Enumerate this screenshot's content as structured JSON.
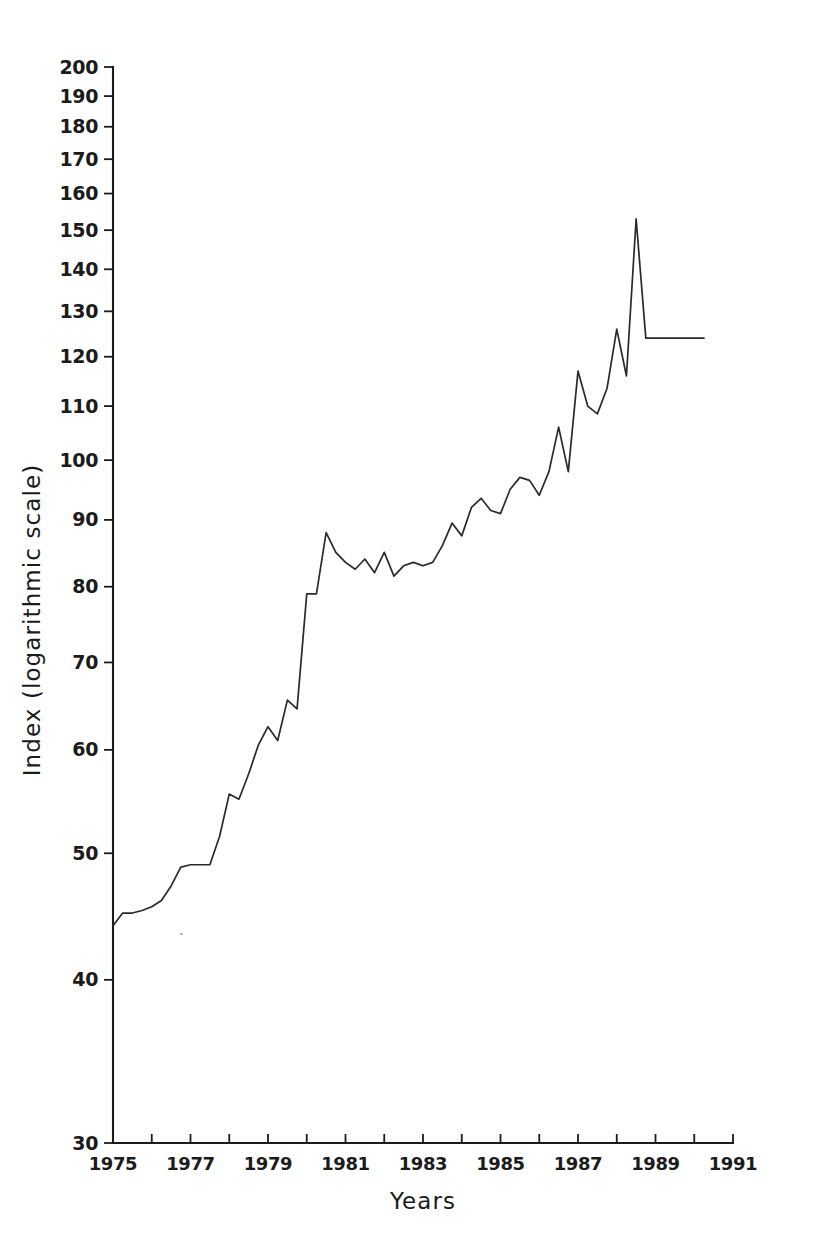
{
  "chart_data": {
    "type": "line",
    "title": "",
    "xlabel": "Years",
    "ylabel": "Index (logarithmic scale)",
    "yscale": "log",
    "ylim": [
      30,
      200
    ],
    "xlim": [
      1975,
      1991
    ],
    "grid": false,
    "legend": null,
    "y_ticks": [
      30,
      40,
      50,
      60,
      70,
      80,
      90,
      100,
      110,
      120,
      130,
      140,
      150,
      160,
      170,
      180,
      190,
      200
    ],
    "y_tick_labels": [
      "30",
      "40",
      "50",
      "60",
      "70",
      "80",
      "90",
      "100",
      "110",
      "120",
      "130",
      "140",
      "150",
      "160",
      "170",
      "180",
      "190",
      "200"
    ],
    "x_ticks": [
      1975,
      1976,
      1977,
      1978,
      1979,
      1980,
      1981,
      1982,
      1983,
      1984,
      1985,
      1986,
      1987,
      1988,
      1989,
      1990,
      1991
    ],
    "x_tick_labels": [
      "1975",
      "",
      "1977",
      "",
      "1979",
      "",
      "1981",
      "",
      "1983",
      "",
      "1985",
      "",
      "1987",
      "",
      "1989",
      "",
      "1991"
    ],
    "x_labeled_ticks": [
      1975,
      1977,
      1979,
      1981,
      1983,
      1985,
      1987,
      1989,
      1991
    ],
    "series": [
      {
        "name": "Index",
        "color": "#2a2a2a",
        "x": [
          1975.0,
          1975.25,
          1975.5,
          1975.75,
          1976.0,
          1976.25,
          1976.5,
          1976.75,
          1977.0,
          1977.25,
          1977.5,
          1977.75,
          1978.0,
          1978.25,
          1978.5,
          1978.75,
          1979.0,
          1979.25,
          1979.5,
          1979.75,
          1980.0,
          1980.25,
          1980.5,
          1980.75,
          1981.0,
          1981.25,
          1981.5,
          1981.75,
          1982.0,
          1982.25,
          1982.5,
          1982.75,
          1983.0,
          1983.25,
          1983.5,
          1983.75,
          1984.0,
          1984.25,
          1984.5,
          1984.75,
          1985.0,
          1985.25,
          1985.5,
          1985.75,
          1986.0,
          1986.25,
          1986.5,
          1986.75,
          1987.0,
          1987.25,
          1987.5,
          1987.75,
          1988.0,
          1988.25,
          1988.5,
          1988.75,
          1989.0,
          1989.25,
          1989.5,
          1989.75,
          1990.0,
          1990.25
        ],
        "y": [
          44.0,
          45.0,
          45.0,
          45.2,
          45.5,
          46.0,
          47.2,
          48.8,
          49.0,
          49.0,
          49.0,
          51.5,
          55.5,
          55.0,
          57.5,
          60.5,
          62.5,
          61.0,
          65.5,
          64.5,
          79.0,
          79.0,
          88.0,
          85.0,
          83.5,
          82.5,
          84.0,
          82.0,
          85.0,
          81.5,
          83.0,
          83.5,
          83.0,
          83.5,
          86.0,
          89.5,
          87.5,
          92.0,
          93.5,
          91.5,
          91.0,
          95.0,
          97.0,
          96.5,
          94.0,
          98.0,
          106.0,
          98.0,
          117.0,
          110.0,
          108.5,
          113.5,
          126.0,
          116.0,
          153.0,
          124.0,
          124.0,
          124.0,
          124.0,
          124.0,
          124.0,
          124.0
        ],
        "description": "Index rises from 44 in 1975 to a sharp peak of about 153 in 1989, then settles near 124 at the end of the series."
      }
    ],
    "annotations": [],
    "key_points": {
      "start": {
        "x": 1975,
        "y": 44
      },
      "first_plateau": {
        "x_range": [
          1977.0,
          1977.5
        ],
        "y": 49
      },
      "interim_peak": {
        "x": 1980.5,
        "y": 88
      },
      "mid_trough": {
        "x": 1982.25,
        "y": 81.5
      },
      "max": {
        "x": 1989.5,
        "y": 153
      },
      "end": {
        "x": 1990.25,
        "y": 124
      }
    }
  },
  "figure": {
    "background_color": "#ffffff",
    "line_color": "#2a2a2a",
    "axis_color": "#1b1b1b"
  }
}
